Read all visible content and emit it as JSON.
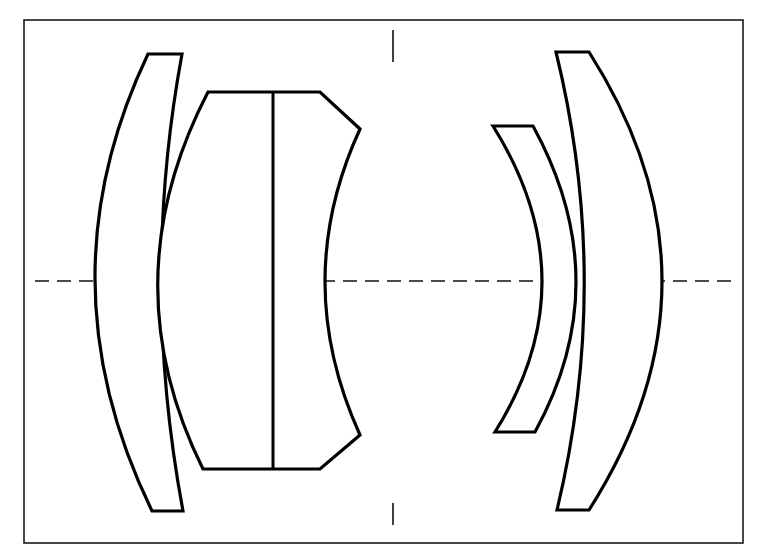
{
  "diagram": {
    "type": "optical lens cross-section",
    "caption": "Lens element layout with optical axis",
    "colors": {
      "background": "#ffffff",
      "stroke": "#000000"
    },
    "frame": {
      "x": 24,
      "y": 20,
      "width": 719,
      "height": 523
    },
    "optical_axis": {
      "y": 281,
      "x1": 35,
      "x2": 735,
      "style": "dashed"
    },
    "aperture_stop": {
      "x": 393,
      "top_mark": [
        30,
        62
      ],
      "bottom_mark": [
        503,
        525
      ]
    },
    "elements": [
      {
        "id": "element-1",
        "name": "front positive meniscus",
        "path": "M148,54 L182,54 Q140,281 183,511 L152,511 Q40,281 148,54 Z"
      },
      {
        "id": "element-2",
        "name": "cemented doublet",
        "path": "M208,92 L320,92 L360,129 Q290,281 360,435 L320,469 L203,469 Q110,281 208,92 Z",
        "cement_line": {
          "x": 273,
          "y1": 92,
          "y2": 469
        }
      },
      {
        "id": "element-3",
        "name": "negative meniscus",
        "path": "M493,126 L533,126 Q618,281 535,432 L495,432 Q590,281 493,126 Z"
      },
      {
        "id": "element-4",
        "name": "rear positive meniscus",
        "path": "M556,52 L589,52 Q735,281 589,510 L557,510 Q612,281 556,52 Z"
      }
    ]
  }
}
